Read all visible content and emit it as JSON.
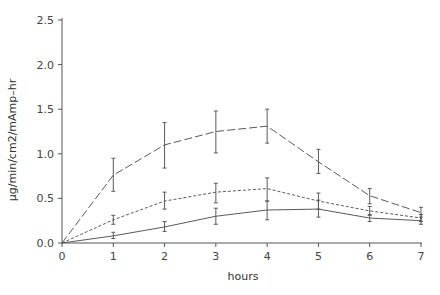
{
  "chart_data": {
    "type": "line",
    "title": "",
    "xlabel": "hours",
    "ylabel": "μg/min/cm2/mAmp–hr",
    "x": [
      0,
      1,
      2,
      3,
      4,
      5,
      6,
      7
    ],
    "xlim": [
      0,
      7
    ],
    "ylim": [
      0,
      2.5
    ],
    "xticks": [
      "0",
      "1",
      "2",
      "3",
      "4",
      "5",
      "6",
      "7"
    ],
    "yticks": [
      "0.0",
      "0.5",
      "1.0",
      "1.5",
      "2.0",
      "2.5"
    ],
    "grid": false,
    "legend": null,
    "series": [
      {
        "name": "series-long-dash",
        "style": "long-dash",
        "values": [
          0,
          0.76,
          1.1,
          1.25,
          1.31,
          0.91,
          0.53,
          0.34
        ],
        "err_low": [
          0,
          0.58,
          0.84,
          1.01,
          1.12,
          0.78,
          0.44,
          0.24
        ],
        "err_high": [
          0,
          0.95,
          1.35,
          1.48,
          1.5,
          1.05,
          0.61,
          0.4
        ]
      },
      {
        "name": "series-short-dash",
        "style": "short-dash",
        "values": [
          0,
          0.26,
          0.47,
          0.57,
          0.61,
          0.47,
          0.36,
          0.28
        ],
        "err_low": [
          0,
          0.21,
          0.38,
          0.45,
          0.47,
          0.38,
          0.31,
          0.24
        ],
        "err_high": [
          0,
          0.31,
          0.57,
          0.67,
          0.73,
          0.56,
          0.41,
          0.32
        ]
      },
      {
        "name": "series-solid",
        "style": "solid",
        "values": [
          0,
          0.08,
          0.18,
          0.3,
          0.37,
          0.38,
          0.28,
          0.25
        ],
        "err_low": [
          0,
          0.05,
          0.13,
          0.21,
          0.26,
          0.29,
          0.24,
          0.21
        ],
        "err_high": [
          0,
          0.12,
          0.24,
          0.39,
          0.47,
          0.48,
          0.32,
          0.29
        ]
      }
    ],
    "colors": {
      "line": "#5a5a5a",
      "axis": "#555555",
      "text": "#444444"
    }
  }
}
